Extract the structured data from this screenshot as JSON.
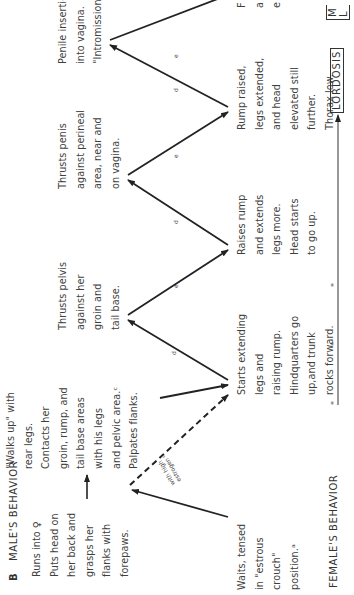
{
  "figure": {
    "panel_letter": "B",
    "male_header": "MALE'S BEHAVIOR",
    "female_header": "FEMALE'S BEHAVIOR",
    "axis_label": "\" \" \"",
    "male_steps": [
      {
        "id": "m1",
        "lines": [
          "Runs into ♀",
          "Puts head on",
          "her back and",
          "grasps her",
          "flanks with",
          "forepaws."
        ]
      },
      {
        "id": "m2",
        "lines": [
          "\"Walks up\" with",
          "rear legs.",
          "Contacts her",
          "groin, rump, and",
          "tail base areas",
          "with his legs",
          "and pelvic area.ᶜ",
          "Palpates flanks."
        ]
      },
      {
        "id": "m3",
        "lines": [
          "Thrusts pelvis",
          "against her",
          "groin and",
          "tail base."
        ]
      },
      {
        "id": "m4",
        "lines": [
          "Thrusts penis",
          "against perineal",
          "area, near and",
          "on vagina."
        ]
      },
      {
        "id": "m5",
        "lines": [
          "Penile insertion",
          "into vagina.",
          "\"Intromission\".ᶠ"
        ]
      }
    ],
    "female_steps": [
      {
        "id": "f1",
        "lines": [
          "Waits, tensed",
          "in \"estrous",
          "crouch\"",
          "position.ᵃ"
        ]
      },
      {
        "id": "f2",
        "lines": [
          "Starts extending",
          "legs and",
          "raising rump.",
          "Hindquarters go",
          "up,and trunk",
          "rocks forward."
        ]
      },
      {
        "id": "f3",
        "lines": [
          "Raises rump",
          "and extends",
          "legs more.",
          "Head starts",
          "to go up."
        ]
      },
      {
        "id": "f4",
        "lines": [
          "Rump raised,",
          "legs extended,",
          "and head",
          "elevated still",
          "further.",
          "Thorax low."
        ]
      },
      {
        "id": "f5",
        "lines": [
          "F",
          "a",
          "e"
        ]
      }
    ],
    "dashed_label": [
      "with high",
      "estrogen ᵇ"
    ],
    "arrow_notes": {
      "d": "d",
      "e": "e"
    },
    "lordosis_label": "LORDOSIS",
    "cut_box_label": [
      "M",
      "L"
    ]
  }
}
